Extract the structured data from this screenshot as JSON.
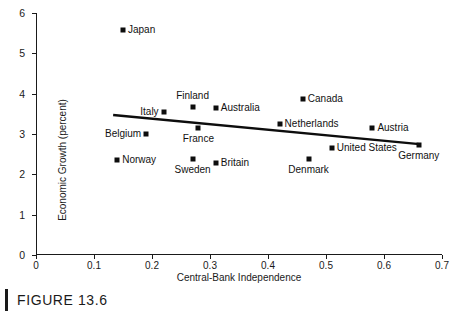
{
  "figure": {
    "caption": "FIGURE 13.6",
    "caption_bar": "caption-rule"
  },
  "chart_data": {
    "type": "scatter",
    "title": "",
    "xlabel": "Central-Bank Independence",
    "ylabel": "Economic Growth (percent)",
    "xlim": [
      0,
      0.7
    ],
    "ylim": [
      0,
      6
    ],
    "xticks": [
      "0",
      "0.1",
      "0.2",
      "0.3",
      "0.4",
      "0.5",
      "0.6",
      "0.7"
    ],
    "xtick_values": [
      0,
      0.1,
      0.2,
      0.3,
      0.4,
      0.5,
      0.6,
      0.7
    ],
    "yticks": [
      "0",
      "1",
      "2",
      "3",
      "4",
      "5",
      "6"
    ],
    "ytick_values": [
      0,
      1,
      2,
      3,
      4,
      5,
      6
    ],
    "grid": false,
    "legend": "none",
    "marker_color": "#0d0d0d",
    "line_color": "#0d0d0d",
    "points": [
      {
        "label": "Japan",
        "x": 0.15,
        "y": 5.57,
        "label_side": "right"
      },
      {
        "label": "Canada",
        "x": 0.46,
        "y": 3.86,
        "label_side": "right"
      },
      {
        "label": "Finland",
        "x": 0.27,
        "y": 3.66,
        "label_side": "above"
      },
      {
        "label": "Australia",
        "x": 0.31,
        "y": 3.64,
        "label_side": "right"
      },
      {
        "label": "Italy",
        "x": 0.22,
        "y": 3.55,
        "label_side": "left"
      },
      {
        "label": "Netherlands",
        "x": 0.42,
        "y": 3.25,
        "label_side": "right"
      },
      {
        "label": "Austria",
        "x": 0.58,
        "y": 3.14,
        "label_side": "right"
      },
      {
        "label": "France",
        "x": 0.28,
        "y": 3.16,
        "label_side": "below"
      },
      {
        "label": "Belgium",
        "x": 0.19,
        "y": 2.99,
        "label_side": "left"
      },
      {
        "label": "Germany",
        "x": 0.66,
        "y": 2.73,
        "label_side": "below"
      },
      {
        "label": "United States",
        "x": 0.51,
        "y": 2.65,
        "label_side": "right"
      },
      {
        "label": "Denmark",
        "x": 0.47,
        "y": 2.39,
        "label_side": "below"
      },
      {
        "label": "Sweden",
        "x": 0.27,
        "y": 2.37,
        "label_side": "below"
      },
      {
        "label": "Norway",
        "x": 0.14,
        "y": 2.35,
        "label_side": "right"
      },
      {
        "label": "Britain",
        "x": 0.31,
        "y": 2.28,
        "label_side": "right"
      }
    ],
    "trendline": {
      "x1": 0.133,
      "y1": 3.47,
      "x2": 0.661,
      "y2": 2.75
    }
  }
}
